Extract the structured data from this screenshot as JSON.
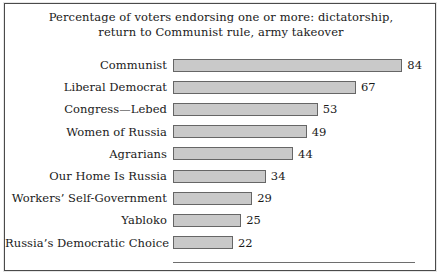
{
  "chart_data": {
    "type": "bar",
    "orientation": "horizontal",
    "title": "Percentage of voters endorsing one or more: dictatorship, return to Communist rule, army takeover",
    "title_lines": [
      "Percentage of voters endorsing one or more: dictatorship,",
      "return to Communist rule, army takeover"
    ],
    "categories": [
      "Communist",
      "Liberal Democrat",
      "Congress—Lebed",
      "Women of Russia",
      "Agrarians",
      "Our Home Is Russia",
      "Workers’ Self-Government",
      "Yabloko",
      "Russia’s Democratic Choice"
    ],
    "values": [
      84,
      67,
      53,
      49,
      44,
      34,
      29,
      25,
      22
    ],
    "value_labels": [
      "84",
      "67",
      "53",
      "49",
      "44",
      "34",
      "29",
      "25",
      "22"
    ],
    "xlabel": "",
    "ylabel": "",
    "xlim": [
      0,
      88
    ],
    "grid": false,
    "legend": null,
    "bar_fill_color": "#c9c9c9",
    "bar_border_color": "#666666",
    "text_color": "#1a1a1a",
    "frame_color": "#4a4a4a",
    "background_color": "#ffffff"
  }
}
